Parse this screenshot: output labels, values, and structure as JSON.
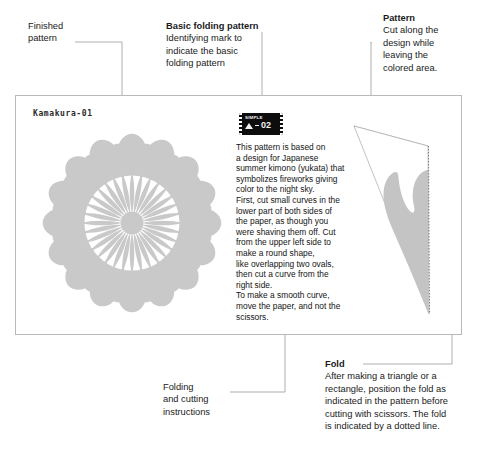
{
  "sheet": {
    "code": "Kamakura-01",
    "badge": {
      "label": "SIMPLE",
      "number": "02",
      "icon": "triangle-fold-icon"
    }
  },
  "callouts": {
    "finished": {
      "name": "finished-pattern",
      "heading": "",
      "lines": [
        "Finished",
        "pattern"
      ],
      "bold_heading": false
    },
    "basic": {
      "name": "basic-folding-pattern",
      "heading": "Basic folding pattern",
      "lines": [
        "Identifying mark to",
        "indicate the basic",
        "folding pattern"
      ],
      "bold_heading": true
    },
    "pattern": {
      "name": "pattern",
      "heading": "Pattern",
      "lines": [
        "Cut along the",
        "design while",
        "leaving the",
        "colored area."
      ],
      "bold_heading": true
    },
    "folding": {
      "name": "folding-and-cutting-instructions",
      "heading": "",
      "lines": [
        "Folding",
        "and cutting",
        "instructions"
      ],
      "bold_heading": false
    },
    "fold": {
      "name": "fold",
      "heading": "Fold",
      "lines": [
        "After making a triangle or a",
        "rectangle, position the fold as",
        "indicated in the pattern before",
        "cutting with scissors. The fold",
        "is indicated by a dotted line."
      ],
      "bold_heading": true
    }
  },
  "instructions": {
    "lines": [
      "This pattern is based on",
      "a design for Japanese",
      "summer kimono (yukata) that",
      "symbolizes fireworks giving",
      "color to the night sky.",
      "First, cut small curves in the",
      "lower part of both sides of",
      "the paper, as though you",
      "were shaving them off. Cut",
      "from the upper left side to",
      "make a round shape,",
      "like overlapping two ovals,",
      "then cut a curve from the",
      "right side.",
      "To make a smooth curve,",
      "move the paper, and not the",
      "scissors."
    ]
  },
  "graphics": {
    "rosette": {
      "name": "finished-rosette-pattern",
      "outer_petals": 16,
      "inner_rays": 32,
      "fill": "#c9c9c9"
    },
    "wedge": {
      "name": "folded-wedge-diagram",
      "fill": "#c4c4c4",
      "outline": "#9a9a9a",
      "fold_line_style": "dotted"
    }
  },
  "colors": {
    "page_background": "#ffffff",
    "card_border": "#b9b9b9",
    "text": "#1a1a1a",
    "leader_line": "#8c8c8c",
    "pattern_gray": "#c9c9c9",
    "badge_background": "#0d0d0d"
  }
}
